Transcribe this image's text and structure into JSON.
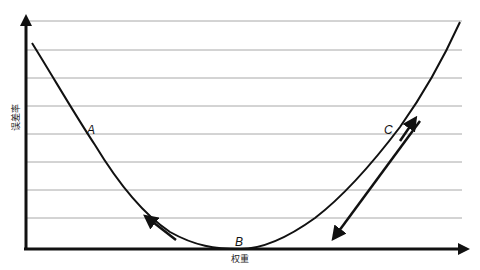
{
  "diagram": {
    "type": "gradient-descent-error-curve",
    "x_axis_label": "权重",
    "y_axis_label": "误差率",
    "points": [
      {
        "label": "A",
        "position": "left slope"
      },
      {
        "label": "B",
        "position": "minimum"
      },
      {
        "label": "C",
        "position": "right slope"
      }
    ],
    "arrows": [
      {
        "name": "arrow-near-B-left",
        "direction": "up-left"
      },
      {
        "name": "arrow-near-C-short",
        "direction": "up-right"
      },
      {
        "name": "arrow-near-C-long",
        "direction": "down-left"
      }
    ],
    "gridlines": 8,
    "colors": {
      "line": "#111111",
      "grid": "#a8a8a8",
      "background": "#ffffff"
    }
  },
  "labels": {
    "A": "A",
    "B": "B",
    "C": "C",
    "x": "权重",
    "y": "误差率"
  }
}
